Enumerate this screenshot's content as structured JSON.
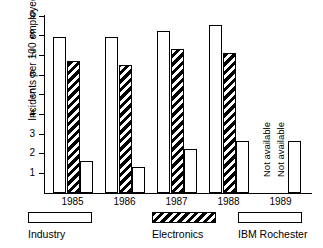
{
  "chart_data": {
    "type": "bar",
    "title": "",
    "xlabel": "",
    "ylabel": "Incidents per 100 employees",
    "ylim": [
      0,
      9
    ],
    "ytick_labels": [
      "9",
      "8",
      "7",
      "6",
      "5",
      "4",
      "3",
      "2",
      "1"
    ],
    "ytick_values": [
      9,
      8,
      7,
      6,
      5,
      4,
      3,
      2,
      1
    ],
    "grid": false,
    "legend_position": "bottom",
    "categories": [
      "1985",
      "1986",
      "1987",
      "1988",
      "1989"
    ],
    "series": [
      {
        "name": "Industry",
        "fill": "dotted",
        "values": [
          7.9,
          7.9,
          8.2,
          8.5,
          null
        ],
        "missing_label": "Not available"
      },
      {
        "name": "Electronics",
        "fill": "diagonal-hatch",
        "values": [
          6.7,
          6.5,
          7.3,
          7.1,
          null
        ],
        "missing_label": "Not available"
      },
      {
        "name": "IBM Rochester",
        "fill": "white",
        "values": [
          1.6,
          1.3,
          2.2,
          2.6,
          2.6
        ],
        "missing_label": ""
      }
    ],
    "annotations": [
      {
        "text": "Not available",
        "category": "1989",
        "series": "Industry",
        "orientation": "vertical"
      },
      {
        "text": "Not available",
        "category": "1989",
        "series": "Electronics",
        "orientation": "vertical"
      }
    ],
    "colors": {
      "axis": "#000000",
      "bar_outline": "#000000",
      "background": "#ffffff"
    }
  },
  "legend": {
    "items": [
      {
        "label": "Industry"
      },
      {
        "label": "Electronics"
      },
      {
        "label": "IBM Rochester"
      }
    ]
  }
}
